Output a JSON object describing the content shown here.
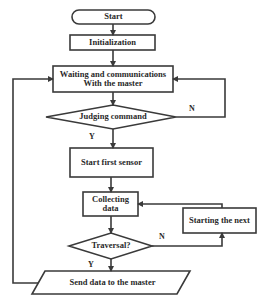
{
  "flowchart": {
    "nodes": {
      "start": {
        "label": "Start",
        "shape": "terminator"
      },
      "init": {
        "label": "Initialization",
        "shape": "process"
      },
      "waiting": {
        "label": "Waiting and communications With the master",
        "shape": "process"
      },
      "judging": {
        "label": "Judging command",
        "shape": "decision"
      },
      "first_sensor": {
        "label": "Start first sensor",
        "shape": "process"
      },
      "collecting": {
        "label": "Collecting data",
        "shape": "process"
      },
      "next": {
        "label": "Starting the next",
        "shape": "process"
      },
      "traversal": {
        "label": "Traversal?",
        "shape": "decision"
      },
      "send": {
        "label": "Send data to the master",
        "shape": "io"
      }
    },
    "edge_labels": {
      "judging_no": "N",
      "judging_yes": "Y",
      "traversal_no": "N",
      "traversal_yes": "Y"
    },
    "colors": {
      "stroke": "#3a3a3a",
      "text": "#2a2a2a",
      "background": "#ffffff"
    }
  }
}
